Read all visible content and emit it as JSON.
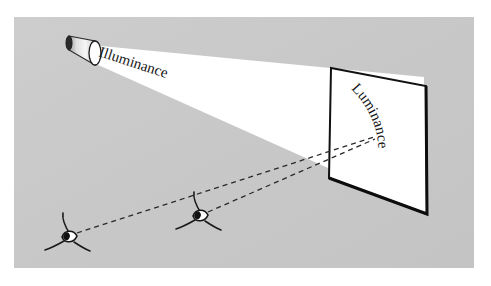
{
  "figure": {
    "kind": "photometry-diagram",
    "caption_absent": true,
    "background_color": "#ffffff",
    "scene_color": "#c9c9c9",
    "beam_color": "#ffffff",
    "ink_color": "#1a1a1a",
    "scene_rect": {
      "x": 14,
      "y": 17,
      "width": 460,
      "height": 251
    }
  },
  "labels": {
    "illuminance": {
      "text": "Illuminance",
      "x": 98,
      "y": 56,
      "rotation": 18,
      "font_size": 15
    },
    "luminance": {
      "text": "Luminance",
      "x": 352,
      "y": 92,
      "rotation": 76,
      "font_size": 15,
      "curved": true
    }
  },
  "objects": {
    "spotlight": {
      "name": "Spotlight lamp emitting the beam",
      "back_center": {
        "x": 69,
        "y": 43
      },
      "back_rx": 3,
      "back_ry": 7,
      "front_center": {
        "x": 95,
        "y": 53
      },
      "front_rx": 6,
      "front_ry": 12,
      "back_fill": "#2a2a2a",
      "front_fill": "#ffffff",
      "body_fill": "#e8e8e8"
    },
    "beam": {
      "name": "Illuminance light cone",
      "points": "92 45 , 424 77 , 424 210 , 95 63"
    },
    "panel": {
      "name": "Illuminated surface / screen",
      "corners": {
        "top_left": {
          "x": 331,
          "y": 68
        },
        "top_right": {
          "x": 426,
          "y": 86
        },
        "bottom_right": {
          "x": 427,
          "y": 214
        },
        "bottom_left": {
          "x": 329,
          "y": 178
        }
      },
      "fill": "#ffffff",
      "stroke": "#111111",
      "stroke_width": 2
    },
    "eye_near": {
      "name": "Observer eye (left, farther from panel)",
      "x": 68,
      "y": 237,
      "scale": 1.0,
      "rotation": 0
    },
    "eye_far": {
      "name": "Observer eye (middle, nearer to panel)",
      "x": 199,
      "y": 216,
      "scale": 1.0,
      "rotation": 0
    },
    "sight_line_near": {
      "name": "Dashed line of sight from left eye to panel",
      "from": {
        "x": 77,
        "y": 233
      },
      "to": {
        "x": 374,
        "y": 137
      },
      "dash": "5 4",
      "stroke": "#222222"
    },
    "sight_line_far": {
      "name": "Dashed line of sight from middle eye to panel",
      "from": {
        "x": 208,
        "y": 212
      },
      "to": {
        "x": 375,
        "y": 139
      },
      "dash": "5 4",
      "stroke": "#222222"
    }
  }
}
